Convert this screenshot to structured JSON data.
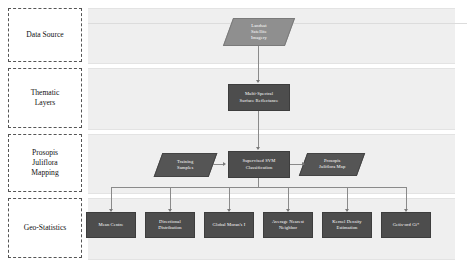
{
  "diagram": {
    "colors": {
      "band_background": "#efefef",
      "node_dark": "#4d4d4d",
      "node_light": "#8f8f8f",
      "connector": "#8a8a8a",
      "stage_border": "#555555"
    },
    "stages": [
      {
        "id": "data-source",
        "label": "Data Source"
      },
      {
        "id": "thematic-layers",
        "label": "Thematic\nLayers"
      },
      {
        "id": "prosopis-juliflora-mapping",
        "label": "Prosopis\nJuliflora\nMapping"
      },
      {
        "id": "geo-statistics",
        "label": "Geo-Statistics"
      }
    ],
    "nodes": {
      "landsat": {
        "label": "Landsat\nSatellite\nImagery",
        "shape": "parallelogram",
        "tone": "light"
      },
      "reflectance": {
        "label": "Multi-Spectral\nSurface Reflectance",
        "shape": "rectangle",
        "tone": "dark"
      },
      "training_samples": {
        "label": "Training\nSamples",
        "shape": "parallelogram",
        "tone": "dark"
      },
      "svm": {
        "label": "Supervised SVM\nClassification",
        "shape": "rectangle",
        "tone": "dark"
      },
      "prosopis_map": {
        "label": "Prosopis\nJuliflora Map",
        "shape": "parallelogram",
        "tone": "dark"
      }
    },
    "geo_statistics": [
      {
        "id": "mean-centre",
        "label": "Mean Centre"
      },
      {
        "id": "directional-distribution",
        "label": "Directional\nDistribution"
      },
      {
        "id": "global-morans-i",
        "label": "Global Moran's I"
      },
      {
        "id": "average-nearest-neighbor",
        "label": "Average Nearest\nNeighbor"
      },
      {
        "id": "kernel-density-estimation",
        "label": "Kernel Density\nEstimation"
      },
      {
        "id": "getis-ord-gi",
        "label": "Getis-ord Gi*"
      }
    ]
  }
}
